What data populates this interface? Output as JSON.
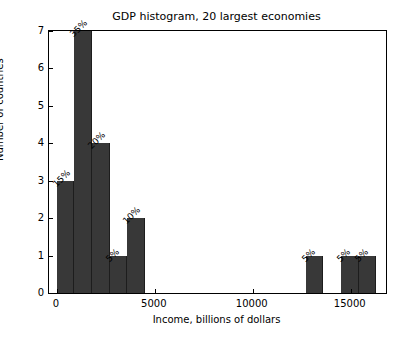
{
  "chart_data": {
    "type": "bar",
    "title": "GDP histogram, 20 largest economies",
    "xlabel": "Income, billions of dollars",
    "ylabel": "Number of countries",
    "xlim": [
      -400,
      16800
    ],
    "ylim": [
      0,
      7
    ],
    "grid": false,
    "legend": null,
    "bin_width": 900,
    "xticks": [
      0,
      5000,
      10000,
      15000
    ],
    "xtick_labels": [
      "0",
      "5000",
      "10000",
      "15000"
    ],
    "yticks": [
      0,
      1,
      2,
      3,
      4,
      5,
      6,
      7
    ],
    "ytick_labels": [
      "0",
      "1",
      "2",
      "3",
      "4",
      "5",
      "6",
      "7"
    ],
    "bar_color": "#383838",
    "bins": [
      {
        "x0": 0,
        "x1": 900,
        "value": 3,
        "label": "15%"
      },
      {
        "x0": 900,
        "x1": 1800,
        "value": 7,
        "label": "35%"
      },
      {
        "x0": 1800,
        "x1": 2700,
        "value": 4,
        "label": "20%"
      },
      {
        "x0": 2700,
        "x1": 3600,
        "value": 1,
        "label": "5%"
      },
      {
        "x0": 3600,
        "x1": 4500,
        "value": 2,
        "label": "10%"
      },
      {
        "x0": 12700,
        "x1": 13600,
        "value": 1,
        "label": "5%"
      },
      {
        "x0": 14500,
        "x1": 15400,
        "value": 1,
        "label": "5%"
      },
      {
        "x0": 15400,
        "x1": 16300,
        "value": 1,
        "label": "5%"
      }
    ]
  }
}
